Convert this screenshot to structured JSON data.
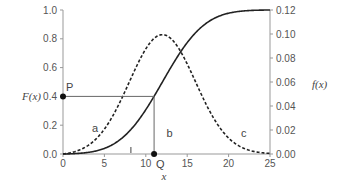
{
  "chart_data": {
    "type": "line",
    "title": "",
    "xlabel": "x",
    "ylabel_left": "F(x)",
    "ylabel_right": "f(x)",
    "xlim": [
      0,
      25
    ],
    "ylim_left": [
      0,
      1.0
    ],
    "ylim_right": [
      0,
      0.12
    ],
    "x_ticks": [
      "0",
      "5",
      "10",
      "15",
      "20",
      "25"
    ],
    "y_left_ticks": [
      "0.0",
      "0.2",
      "0.4",
      "0.6",
      "0.8",
      "1.0"
    ],
    "y_right_ticks": [
      "0.00",
      "0.02",
      "0.04",
      "0.06",
      "0.08",
      "0.10",
      "0.12"
    ],
    "series": [
      {
        "name": "F(x) cumulative",
        "style": "solid",
        "axis": "left",
        "x": [
          0,
          2,
          4,
          6,
          8,
          10,
          11,
          12,
          14,
          16,
          18,
          20,
          22,
          25
        ],
        "values": [
          0.0,
          0.01,
          0.04,
          0.1,
          0.21,
          0.35,
          0.4,
          0.5,
          0.66,
          0.8,
          0.9,
          0.96,
          0.99,
          1.0
        ]
      },
      {
        "name": "f(x) density",
        "style": "dashed",
        "axis": "right",
        "x": [
          0,
          2,
          4,
          6,
          8,
          10,
          12,
          14,
          16,
          18,
          20,
          22,
          25
        ],
        "values": [
          0.0,
          0.005,
          0.02,
          0.045,
          0.075,
          0.095,
          0.1,
          0.09,
          0.065,
          0.035,
          0.015,
          0.005,
          0.0
        ]
      }
    ],
    "annotations": [
      {
        "label": "P",
        "x": 0,
        "y": 0.4
      },
      {
        "label": "Q",
        "x": 11,
        "y": 0.0
      },
      {
        "label": "a",
        "x": 3.5,
        "y": 0.15
      },
      {
        "label": "b",
        "x": 12.5,
        "y": 0.12
      },
      {
        "label": "c",
        "x": 21.5,
        "y": 0.12
      },
      {
        "label": "l",
        "x": 8.2,
        "y": 0.02
      }
    ],
    "grid": false,
    "legend": "none"
  }
}
